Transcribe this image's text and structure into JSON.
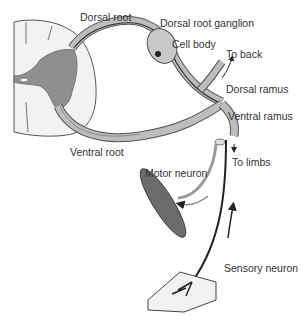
{
  "diagram": {
    "labels": {
      "dorsal_root": "Dorsal root",
      "dorsal_root_ganglion": "Dorsal root ganglion",
      "cell_body": "Cell body",
      "to_back": "To back",
      "dorsal_ramus": "Dorsal ramus",
      "ventral_ramus": "Ventral ramus",
      "ventral_root": "Ventral root",
      "to_limbs": "To limbs",
      "motor_neuron": "Motor neuron",
      "sensory_neuron": "Sensory neuron"
    },
    "colors": {
      "gray_matter": "#8f8f8f",
      "white_matter": "#f2f2f2",
      "nerve_fill": "#b8b8b8",
      "nerve_outline": "#555555",
      "neuron_line": "#222222"
    }
  }
}
